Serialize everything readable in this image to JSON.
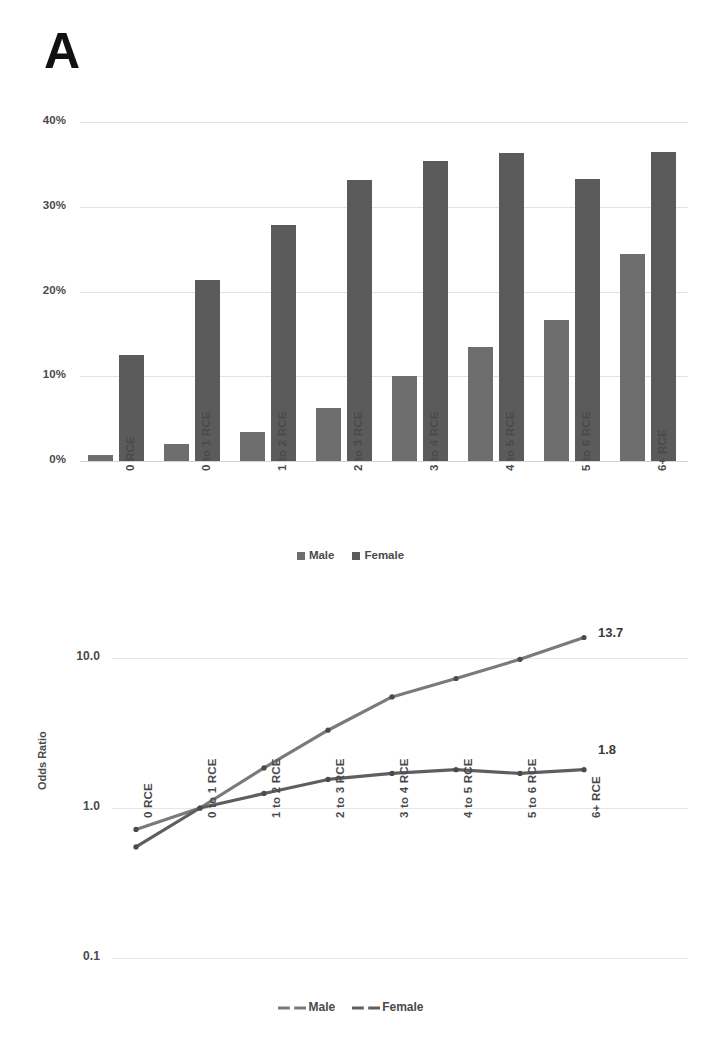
{
  "figure": {
    "panel_a_letter": "A",
    "panel_b_letter": "B"
  },
  "panelA": {
    "y_ticks": [
      "40%",
      "30%",
      "20%",
      "10%",
      "0%"
    ],
    "x_labels": [
      "0 RCE",
      "0 to 1 RCE",
      "1 to 2 RCE",
      "2 to 3 RCE",
      "3 to 4 RCE",
      "4 to 5 RCE",
      "5 to 6 RCE",
      "6+ RCE"
    ],
    "legend": [
      {
        "label": "Male",
        "color": "#6e6e6e"
      },
      {
        "label": "Female",
        "color": "#5b5b5b"
      }
    ]
  },
  "panelB": {
    "y_ticks": [
      "10.0",
      "1.0",
      "0.1"
    ],
    "y_axis_title": "Odds Ratio",
    "x_labels": [
      "0 RCE",
      "0 to 1 RCE",
      "1 to 2 RCE",
      "2 to 3 RCE",
      "3 to 4 RCE",
      "4 to 5 RCE",
      "5 to 6 RCE",
      "6+ RCE"
    ],
    "end_labels": {
      "male": "13.7",
      "female": "1.8"
    },
    "legend": [
      {
        "label": "Male",
        "color": "#7a7a7a"
      },
      {
        "label": "Female",
        "color": "#5e5e5e"
      }
    ]
  },
  "chart_data": [
    {
      "type": "bar",
      "panel": "A",
      "title": "",
      "xlabel": "",
      "ylabel": "",
      "categories": [
        "0 RCE",
        "0 to 1 RCE",
        "1 to 2 RCE",
        "2 to 3 RCE",
        "3 to 4 RCE",
        "4 to 5 RCE",
        "5 to 6 RCE",
        "6+ RCE"
      ],
      "series": [
        {
          "name": "Male",
          "color": "#6e6e6e",
          "values": [
            0.7,
            2.0,
            3.4,
            6.2,
            10.0,
            13.5,
            16.6,
            24.4
          ]
        },
        {
          "name": "Female",
          "color": "#5b5b5b",
          "values": [
            12.5,
            21.4,
            27.9,
            33.2,
            35.4,
            36.3,
            33.3,
            36.5
          ]
        }
      ],
      "ylim": [
        0,
        40
      ],
      "ytick_values": [
        40,
        30,
        20,
        10,
        0
      ],
      "ytick_labels": [
        "40%",
        "30%",
        "20%",
        "10%",
        "0%"
      ],
      "yscale": "linear",
      "grid": true,
      "legend_position": "bottom"
    },
    {
      "type": "line",
      "panel": "B",
      "title": "",
      "xlabel": "",
      "ylabel": "Odds Ratio",
      "categories": [
        "0 RCE",
        "0 to 1 RCE",
        "1 to 2 RCE",
        "2 to 3 RCE",
        "3 to 4 RCE",
        "4 to 5 RCE",
        "5 to 6 RCE",
        "6+ RCE"
      ],
      "series": [
        {
          "name": "Male",
          "color": "#7a7a7a",
          "values": [
            0.72,
            1.0,
            1.85,
            3.3,
            5.5,
            7.3,
            9.8,
            13.7
          ],
          "end_label": "13.7"
        },
        {
          "name": "Female",
          "color": "#5e5e5e",
          "values": [
            0.55,
            1.0,
            1.25,
            1.55,
            1.7,
            1.8,
            1.7,
            1.8
          ],
          "end_label": "1.8"
        }
      ],
      "ylim": [
        0.1,
        20
      ],
      "ytick_values": [
        10.0,
        1.0,
        0.1
      ],
      "ytick_labels": [
        "10.0",
        "1.0",
        "0.1"
      ],
      "yscale": "log",
      "grid": true,
      "legend_position": "bottom"
    }
  ]
}
